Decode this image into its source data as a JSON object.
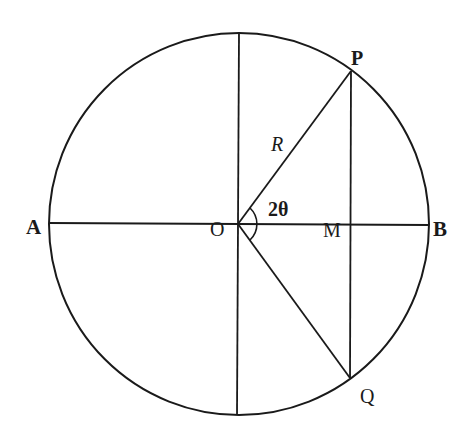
{
  "diagram": {
    "type": "geometry",
    "stroke_color": "#1a1a1a",
    "background": "#ffffff",
    "circle": {
      "cx": 239,
      "cy": 224,
      "r": 190
    },
    "points": {
      "A": {
        "label": "A",
        "x": 49,
        "y": 224
      },
      "B": {
        "label": "B",
        "x": 429,
        "y": 224
      },
      "O": {
        "label": "O",
        "x": 238,
        "y": 224
      },
      "P": {
        "label": "P",
        "x": 351,
        "y": 71
      },
      "Q": {
        "label": "Q",
        "x": 350,
        "y": 378
      },
      "M": {
        "label": "M",
        "x": 351,
        "y": 224
      },
      "Top": {
        "x": 239,
        "y": 33
      },
      "Bottom": {
        "x": 237,
        "y": 415
      }
    },
    "labels": {
      "A": "A",
      "B": "B",
      "O": "O",
      "P": "P",
      "Q": "Q",
      "M": "M",
      "radius": "R",
      "angle": "2θ"
    },
    "segments": [
      {
        "name": "diameter-AB",
        "from": "A",
        "to": "B"
      },
      {
        "name": "vertical-diameter",
        "from": "Top",
        "to": "Bottom"
      },
      {
        "name": "radius-OP",
        "from": "O",
        "to": "P"
      },
      {
        "name": "radius-OQ",
        "from": "O",
        "to": "Q"
      },
      {
        "name": "chord-PQ",
        "from": "P",
        "to": "Q"
      }
    ],
    "angle_arc": {
      "vertex": "O",
      "between": [
        "P",
        "Q"
      ],
      "radius": 22,
      "label": "2θ"
    }
  }
}
